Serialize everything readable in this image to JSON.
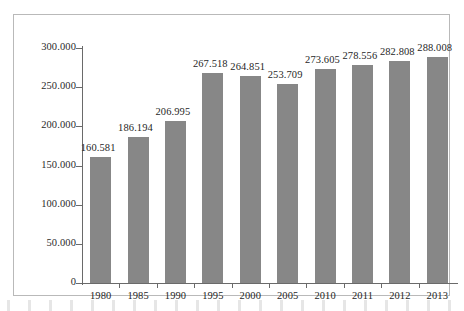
{
  "chart_data": {
    "type": "bar",
    "title": "",
    "subtitle": "",
    "xlabel": "",
    "ylabel": "",
    "categories": [
      "1980",
      "1985",
      "1990",
      "1995",
      "2000",
      "2005",
      "2010",
      "2011",
      "2012",
      "2013"
    ],
    "values": [
      160581,
      186194,
      206995,
      267518,
      264851,
      253709,
      273605,
      278556,
      282808,
      288008
    ],
    "data_labels": [
      "160.581",
      "186.194",
      "206.995",
      "267.518",
      "264.851",
      "253.709",
      "273.605",
      "278.556",
      "282.808",
      "288.008"
    ],
    "ylim": [
      0,
      300000
    ],
    "ytick_values": [
      0,
      50000,
      100000,
      150000,
      200000,
      250000,
      300000
    ],
    "ytick_labels": [
      "0",
      "50.000",
      "100.000",
      "150.000",
      "200.000",
      "250.000",
      "300.000"
    ],
    "grid": false,
    "legend": null,
    "legend_position": "none",
    "series": [
      {
        "name": "",
        "values": [
          160581,
          186194,
          206995,
          267518,
          264851,
          253709,
          273605,
          278556,
          282808,
          288008
        ],
        "color": "#878787"
      }
    ],
    "colors": {
      "bar": "#878787",
      "axis": "#6a6a6a",
      "frame": "#b9b9b9",
      "text": "#1f1f1f",
      "background": "#ffffff"
    }
  }
}
